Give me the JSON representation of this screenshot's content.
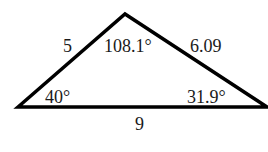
{
  "diagram": {
    "type": "triangle",
    "vertices": {
      "left": {
        "x": 18,
        "y": 107
      },
      "top": {
        "x": 125,
        "y": 14
      },
      "right": {
        "x": 267,
        "y": 107
      }
    },
    "sides": {
      "left_top": "5",
      "top_right": "6.09",
      "bottom": "9"
    },
    "angles": {
      "top": "108.1°",
      "left": "40°",
      "right": "31.9°"
    },
    "colors": {
      "stroke": "#000000",
      "text": "#1a1a1a",
      "background": "#ffffff"
    }
  }
}
